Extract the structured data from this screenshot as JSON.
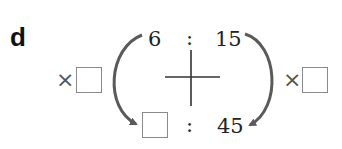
{
  "question_label": "d",
  "ratio_top": {
    "left": "6",
    "separator": ":",
    "right": "15"
  },
  "ratio_bottom": {
    "left": "",
    "separator": ":",
    "right": "45"
  },
  "left_operator": {
    "symbol": "×",
    "value": ""
  },
  "right_operator": {
    "symbol": "×",
    "value": ""
  },
  "colors": {
    "arrow": "#5a5a5a",
    "box_border": "#8a8a8a",
    "text": "#222222"
  }
}
